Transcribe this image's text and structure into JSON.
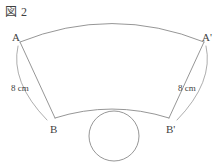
{
  "figure": {
    "caption": "図 2",
    "background_color": "#ffffff",
    "stroke_color": "#8a8a8a",
    "text_color": "#3f3f3f"
  },
  "points": {
    "A": {
      "label": "A",
      "x": 20,
      "y": 42
    },
    "Ap": {
      "label": "A'",
      "x": 204,
      "y": 42
    },
    "B": {
      "label": "B",
      "x": 55,
      "y": 118
    },
    "Bp": {
      "label": "B'",
      "x": 169,
      "y": 118
    }
  },
  "measurements": {
    "left_side": {
      "label": "8 cm",
      "value": 8,
      "unit": "cm",
      "segment": "AB"
    },
    "right_side": {
      "label": "8 cm",
      "value": 8,
      "unit": "cm",
      "segment": "A'B'"
    }
  },
  "shapes": {
    "sector_band": {
      "outer_arc": {
        "from": "A",
        "to": "A'",
        "peak_y": 20
      },
      "inner_arc": {
        "from": "B",
        "to": "B'",
        "peak_y": 109
      },
      "left_edge": {
        "from": "A",
        "to": "B"
      },
      "right_edge": {
        "from": "A'",
        "to": "B'"
      }
    },
    "circle": {
      "center_x": 114,
      "center_y": 136,
      "radius": 25,
      "tangent_to": "inner_arc"
    }
  }
}
